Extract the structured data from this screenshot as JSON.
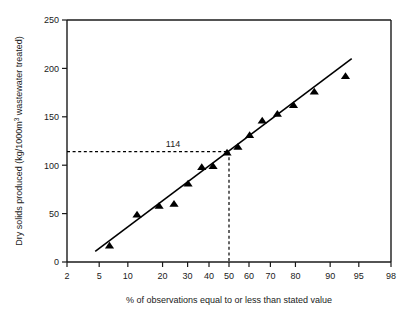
{
  "chart_data": {
    "type": "scatter",
    "title": "",
    "xlabel": "% of observations equal to or less than stated value",
    "ylabel": "Dry solids produced (kg/1000m3 wastewater treated)",
    "ylabel_parts": {
      "pre": "Dry solids produced (kg/1000m",
      "sup": "3",
      "post": " wastewater treated)"
    },
    "x_scale": "probability",
    "xlim": [
      2,
      98
    ],
    "ylim": [
      0,
      250
    ],
    "xticks": [
      2,
      5,
      10,
      20,
      30,
      40,
      50,
      60,
      70,
      80,
      90,
      95,
      98
    ],
    "xtick_labels": [
      "2",
      "5",
      "10",
      "20",
      "30",
      "40",
      "50",
      "60",
      "70",
      "80",
      "90",
      "95",
      "98"
    ],
    "yticks": [
      0,
      50,
      100,
      150,
      200,
      250
    ],
    "ytick_labels": [
      "0",
      "50",
      "100",
      "150",
      "200",
      "250"
    ],
    "grid": false,
    "legend": null,
    "marker": "triangle",
    "marker_color": "#000000",
    "line_color": "#000000",
    "points": [
      {
        "x": 6.5,
        "y": 17
      },
      {
        "x": 12.2,
        "y": 49
      },
      {
        "x": 18.8,
        "y": 58
      },
      {
        "x": 24.3,
        "y": 60
      },
      {
        "x": 30.2,
        "y": 81
      },
      {
        "x": 36.5,
        "y": 98
      },
      {
        "x": 42.0,
        "y": 99
      },
      {
        "x": 49.0,
        "y": 113
      },
      {
        "x": 54.5,
        "y": 119
      },
      {
        "x": 60.3,
        "y": 131
      },
      {
        "x": 66.3,
        "y": 146
      },
      {
        "x": 73.0,
        "y": 153
      },
      {
        "x": 79.3,
        "y": 162
      },
      {
        "x": 86.0,
        "y": 176
      },
      {
        "x": 93.0,
        "y": 192
      }
    ],
    "fit_line": {
      "x1": 4.5,
      "y1": 11,
      "x2": 94.0,
      "y2": 210
    },
    "annotations": [
      {
        "label": "114",
        "value": 114,
        "at_percentile": 50,
        "h_dash_from_x": 2,
        "v_dash_to_y": 0
      }
    ]
  }
}
